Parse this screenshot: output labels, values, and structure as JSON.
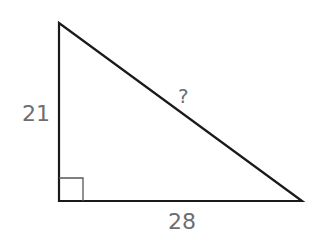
{
  "diagram": {
    "type": "right-triangle",
    "vertices": {
      "top": [
        59,
        23
      ],
      "right_angle": [
        59,
        201
      ],
      "right": [
        302,
        201
      ]
    },
    "labels": {
      "vertical_leg": "21",
      "horizontal_leg": "28",
      "hypotenuse": "?"
    },
    "right_angle_marker": true,
    "colors": {
      "stroke": "#1a1a1a",
      "marker": "#555555",
      "label": "#6e6e6e"
    }
  }
}
